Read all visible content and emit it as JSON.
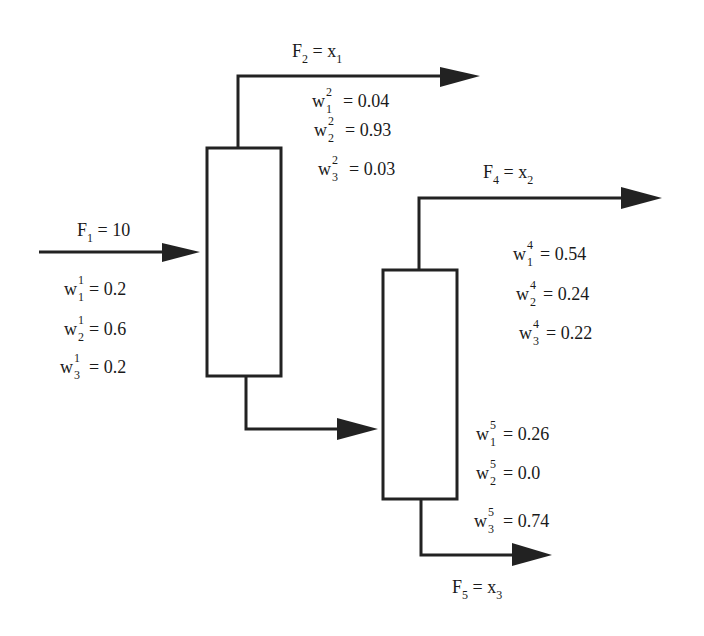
{
  "diagram": {
    "type": "separation-process-flowsheet",
    "units": [
      {
        "id": "column-1",
        "label": ""
      },
      {
        "id": "column-2",
        "label": ""
      }
    ],
    "streams": {
      "F1": {
        "name": "F",
        "index": "1",
        "equals": "= 10",
        "fractions": [
          {
            "w": "w",
            "sup": "1",
            "sub": "1",
            "value": "= 0.2"
          },
          {
            "w": "w",
            "sup": "1",
            "sub": "2",
            "value": "= 0.6"
          },
          {
            "w": "w",
            "sup": "1",
            "sub": "3",
            "value": "= 0.2"
          }
        ]
      },
      "F2": {
        "name": "F",
        "index": "2",
        "equals": "= x",
        "var_index": "1",
        "fractions": [
          {
            "w": "w",
            "sup": "2",
            "sub": "1",
            "value": "= 0.04"
          },
          {
            "w": "w",
            "sup": "2",
            "sub": "2",
            "value": "= 0.93"
          },
          {
            "w": "w",
            "sup": "2",
            "sub": "3",
            "value": "= 0.03"
          }
        ]
      },
      "F4": {
        "name": "F",
        "index": "4",
        "equals": "= x",
        "var_index": "2",
        "fractions": [
          {
            "w": "w",
            "sup": "4",
            "sub": "1",
            "value": "= 0.54"
          },
          {
            "w": "w",
            "sup": "4",
            "sub": "2",
            "value": "= 0.24"
          },
          {
            "w": "w",
            "sup": "4",
            "sub": "3",
            "value": "= 0.22"
          }
        ]
      },
      "F5": {
        "name": "F",
        "index": "5",
        "equals": "= x",
        "var_index": "3",
        "fractions": [
          {
            "w": "w",
            "sup": "5",
            "sub": "1",
            "value": "= 0.26"
          },
          {
            "w": "w",
            "sup": "5",
            "sub": "2",
            "value": "= 0.0"
          },
          {
            "w": "w",
            "sup": "5",
            "sub": "3",
            "value": "= 0.74"
          }
        ]
      }
    },
    "colors": {
      "line": "#222222",
      "background": "#ffffff"
    }
  }
}
